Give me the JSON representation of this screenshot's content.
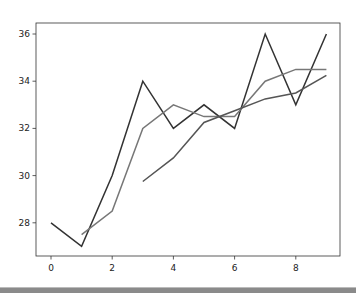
{
  "chart_data": {
    "type": "line",
    "title": "",
    "xlabel": "",
    "ylabel": "",
    "xlim": [
      -0.45,
      9.45
    ],
    "ylim": [
      26.55,
      36.45
    ],
    "x_ticks": [
      0,
      2,
      4,
      6,
      8
    ],
    "y_ticks": [
      28,
      30,
      32,
      34,
      36
    ],
    "grid": false,
    "legend": null,
    "series": [
      {
        "name": "series",
        "color": "#333333",
        "x": [
          0,
          1,
          2,
          3,
          4,
          5,
          6,
          7,
          8,
          9
        ],
        "values": [
          28,
          27,
          30,
          34,
          32,
          33,
          32,
          36,
          33,
          36
        ]
      },
      {
        "name": "rolling_mean_2",
        "color": "#777777",
        "x": [
          1,
          2,
          3,
          4,
          5,
          6,
          7,
          8,
          9
        ],
        "values": [
          27.5,
          28.5,
          32,
          33,
          32.5,
          32.5,
          34,
          34.5,
          34.5
        ]
      },
      {
        "name": "rolling_mean_4",
        "color": "#555555",
        "x": [
          3,
          4,
          5,
          6,
          7,
          8,
          9
        ],
        "values": [
          29.75,
          30.75,
          32.25,
          32.75,
          33.25,
          33.5,
          34.25
        ]
      }
    ]
  },
  "layout": {
    "plot_left": 36,
    "plot_top": 23,
    "plot_right": 340,
    "plot_bottom": 256,
    "x0_px": 51,
    "x_px_per_unit": 30.6,
    "y36_px": 34,
    "y_px_per_unit": 23.6
  }
}
